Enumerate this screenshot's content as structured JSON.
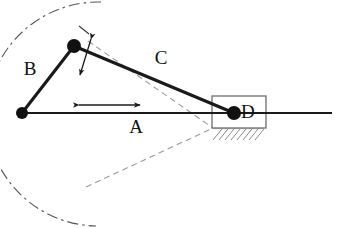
{
  "figure": {
    "background": "#ffffff",
    "stroke_color": "#1a1a1a",
    "dashed_color": "#8c8c8c",
    "arc_color": "#555555",
    "joint_color": "#111111",
    "block_stroke": "#6e6e6e"
  },
  "labels": {
    "link_a": "A",
    "link_b": "B",
    "link_c": "C",
    "joint_d": "D"
  },
  "label_positions": {
    "link_a": {
      "x": 136,
      "y": 133
    },
    "link_b": {
      "x": 30,
      "y": 75
    },
    "link_c": {
      "x": 161,
      "y": 64
    },
    "joint_d": {
      "x": 241,
      "y": 118
    }
  },
  "geometry": {
    "ground_pivot": {
      "x": 22,
      "y": 113
    },
    "crank_joint": {
      "x": 74,
      "y": 46
    },
    "slider_joint": {
      "x": 234,
      "y": 113
    },
    "ground_line": {
      "x1": 22,
      "y1": 113,
      "x2": 332,
      "y2": 113
    },
    "link_b_line": {
      "x1": 22,
      "y1": 113,
      "x2": 74,
      "y2": 46
    },
    "link_c_line": {
      "x1": 74,
      "y1": 46,
      "x2": 234,
      "y2": 113
    },
    "slider_block": {
      "x": 212,
      "y": 96,
      "width": 54,
      "height": 32
    },
    "hatching": {
      "x": 212,
      "y": 128,
      "width": 52,
      "height": 12,
      "lines": 9
    }
  },
  "annotations": {
    "arc": {
      "kind": "dash-dot-arc",
      "center": {
        "x": 22,
        "y": 113
      },
      "radius": 85,
      "start": {
        "x": 101,
        "y": 2
      },
      "end": {
        "x": 96,
        "y": 226
      }
    },
    "arc_tick": {
      "x1": 79,
      "y1": 26,
      "x2": 89,
      "y2": 34
    },
    "dashed_upper": {
      "x1": 88,
      "y1": 41,
      "x2": 213,
      "y2": 128
    },
    "dashed_lower": {
      "x1": 86,
      "y1": 187,
      "x2": 213,
      "y2": 128
    },
    "arrow_a": {
      "kind": "double-headed-horizontal",
      "x1": 78,
      "y1": 105,
      "x2": 141,
      "y2": 105
    },
    "arrow_joint": {
      "kind": "double-headed-oblique",
      "x1": 92,
      "y1": 38,
      "x2": 79,
      "y2": 76
    }
  }
}
